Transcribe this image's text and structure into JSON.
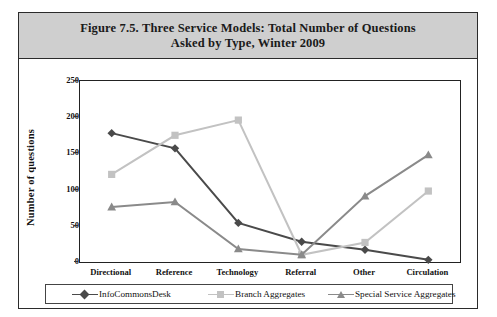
{
  "figure": {
    "title_line1": "Figure 7.5.  Three Service Models: Total Number of Questions",
    "title_line2": "Asked by Type, Winter 2009"
  },
  "chart_data": {
    "type": "line",
    "title": "Figure 7.5.  Three Service Models: Total Number of Questions Asked by Type, Winter 2009",
    "xlabel": "",
    "ylabel": "Number of questions",
    "categories": [
      "Directional",
      "Reference",
      "Technology",
      "Referral",
      "Other",
      "Circulation"
    ],
    "ylim": [
      0,
      250
    ],
    "yticks": [
      0,
      50,
      100,
      150,
      200,
      250
    ],
    "grid": false,
    "legend_position": "bottom",
    "series": [
      {
        "name": "InfoCommonsDesk",
        "marker": "diamond",
        "color": "#4a4a4a",
        "values": [
          178,
          157,
          54,
          28,
          17,
          3
        ]
      },
      {
        "name": "Branch Aggregates",
        "marker": "square",
        "color": "#c2c2c2",
        "values": [
          121,
          175,
          196,
          10,
          27,
          98
        ]
      },
      {
        "name": "Special Service Aggregates",
        "marker": "triangle",
        "color": "#8a8a8a",
        "values": [
          76,
          83,
          18,
          10,
          91,
          148
        ]
      }
    ]
  },
  "colors": {
    "title_band": "#cfcfcf",
    "frame": "#2b2b2b",
    "axis": "#222222",
    "series_1": "#4a4a4a",
    "series_2": "#c2c2c2",
    "series_3": "#8a8a8a"
  }
}
